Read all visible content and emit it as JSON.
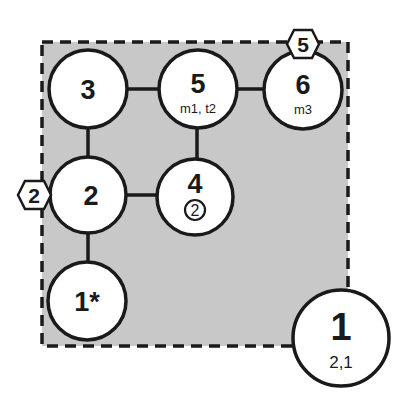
{
  "diagram": {
    "region": {
      "fill": "#c8c8c8",
      "border": "dashed",
      "stroke": "#1a1a1a"
    },
    "nodes": [
      {
        "id": "n3",
        "label": "3",
        "sub": ""
      },
      {
        "id": "n5",
        "label": "5",
        "sub": "m1, t2"
      },
      {
        "id": "n6",
        "label": "6",
        "sub": "m3"
      },
      {
        "id": "n2",
        "label": "2",
        "sub": ""
      },
      {
        "id": "n4",
        "label": "4",
        "sub": "2"
      },
      {
        "id": "n1star",
        "label": "1*",
        "sub": ""
      },
      {
        "id": "n1",
        "label": "1",
        "sub": "2,1"
      }
    ],
    "edges": [
      [
        "3",
        "5"
      ],
      [
        "5",
        "6"
      ],
      [
        "3",
        "2"
      ],
      [
        "5",
        "4"
      ],
      [
        "2",
        "4"
      ],
      [
        "2",
        "1*"
      ]
    ],
    "hex_badges": [
      {
        "attached_to": "2",
        "label": "2"
      },
      {
        "attached_to": "6",
        "label": "5"
      }
    ],
    "colors": {
      "line": "#1a1a1a",
      "node_fill": "#ffffff",
      "region_fill": "#c8c8c8"
    }
  }
}
